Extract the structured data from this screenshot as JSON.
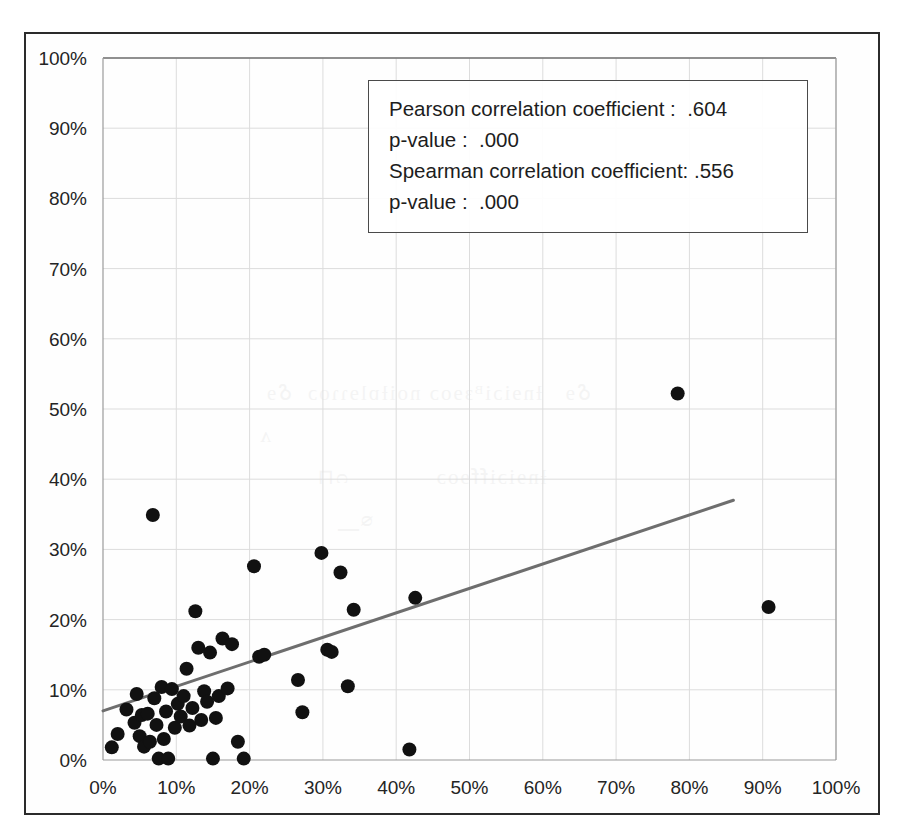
{
  "figure": {
    "background_color": "#ffffff",
    "frame_color": "#2b2b2b",
    "plot_border_color": "#9a9a9a",
    "grid_color": "#dcdcdc",
    "marker_color": "#111111",
    "trendline_color": "#6e6e6e",
    "axis_label_color": "#242424",
    "stats_box_border_color": "#4a4a4a"
  },
  "stats": {
    "pearson_label": "Pearson correlation coefficient :  .604",
    "pearson_pvalue": "p-value :  .000",
    "spearman_label": "Spearman correlation coefficient: .556",
    "spearman_pvalue": "p-value :  .000"
  },
  "chart_data": {
    "type": "scatter",
    "title": "",
    "subtitle": "",
    "xlabel": "",
    "ylabel": "",
    "xlim": [
      0,
      100
    ],
    "ylim": [
      0,
      100
    ],
    "grid": true,
    "legend": "none",
    "x_tick_labels": [
      "0%",
      "10%",
      "20%",
      "30%",
      "40%",
      "50%",
      "60%",
      "70%",
      "80%",
      "90%",
      "100%"
    ],
    "y_tick_labels": [
      "0%",
      "10%",
      "20%",
      "30%",
      "40%",
      "50%",
      "60%",
      "70%",
      "80%",
      "90%",
      "100%"
    ],
    "x_ticks": [
      0,
      10,
      20,
      30,
      40,
      50,
      60,
      70,
      80,
      90,
      100
    ],
    "y_ticks": [
      0,
      10,
      20,
      30,
      40,
      50,
      60,
      70,
      80,
      90,
      100
    ],
    "annotations": [
      "Pearson correlation coefficient :  .604",
      "p-value :  .000",
      "Spearman correlation coefficient: .556",
      "p-value :  .000"
    ],
    "series": [
      {
        "name": "observations",
        "marker": "filled-circle",
        "marker_size": 14,
        "color": "#111111",
        "points": [
          [
            1.2,
            1.8
          ],
          [
            2.0,
            3.7
          ],
          [
            3.2,
            7.2
          ],
          [
            4.3,
            5.3
          ],
          [
            4.6,
            9.4
          ],
          [
            5.0,
            3.4
          ],
          [
            5.3,
            6.4
          ],
          [
            5.6,
            1.9
          ],
          [
            6.1,
            6.6
          ],
          [
            6.4,
            2.6
          ],
          [
            6.8,
            34.9
          ],
          [
            7.0,
            8.8
          ],
          [
            7.3,
            5.0
          ],
          [
            7.6,
            0.2
          ],
          [
            8.0,
            10.4
          ],
          [
            8.3,
            3.0
          ],
          [
            8.6,
            6.9
          ],
          [
            8.9,
            0.2
          ],
          [
            9.4,
            10.1
          ],
          [
            9.8,
            4.6
          ],
          [
            10.2,
            8.0
          ],
          [
            10.6,
            6.2
          ],
          [
            11.0,
            9.1
          ],
          [
            11.4,
            13.0
          ],
          [
            11.8,
            4.9
          ],
          [
            12.2,
            7.4
          ],
          [
            12.6,
            21.2
          ],
          [
            13.0,
            16.0
          ],
          [
            13.4,
            5.7
          ],
          [
            13.8,
            9.8
          ],
          [
            14.2,
            8.3
          ],
          [
            14.6,
            15.3
          ],
          [
            15.0,
            0.2
          ],
          [
            15.4,
            6.0
          ],
          [
            15.8,
            9.1
          ],
          [
            16.3,
            17.3
          ],
          [
            17.0,
            10.2
          ],
          [
            17.6,
            16.5
          ],
          [
            18.4,
            2.6
          ],
          [
            19.2,
            0.2
          ],
          [
            20.6,
            27.6
          ],
          [
            21.3,
            14.7
          ],
          [
            22.0,
            15.0
          ],
          [
            26.6,
            11.4
          ],
          [
            27.2,
            6.8
          ],
          [
            29.8,
            29.5
          ],
          [
            30.6,
            15.7
          ],
          [
            31.2,
            15.4
          ],
          [
            32.4,
            26.7
          ],
          [
            33.4,
            10.5
          ],
          [
            34.2,
            21.4
          ],
          [
            41.8,
            1.5
          ],
          [
            42.6,
            23.1
          ],
          [
            78.4,
            52.2
          ],
          [
            90.8,
            21.8
          ]
        ]
      }
    ],
    "trendline": {
      "type": "linear",
      "color": "#6e6e6e",
      "width": 3,
      "x_start": 0.0,
      "y_start": 7.0,
      "x_end": 86.0,
      "y_end": 37.0
    }
  }
}
